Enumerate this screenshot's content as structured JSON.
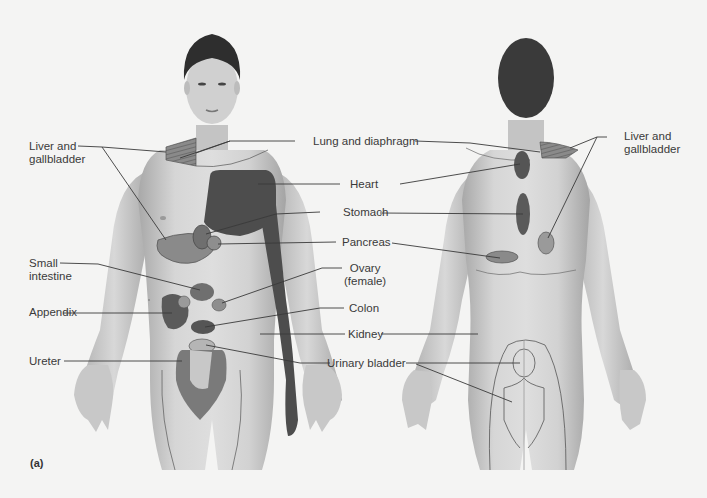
{
  "figure": {
    "panel_label": "(a)",
    "style": "grayscale",
    "colors": {
      "background": "#f4f4f3",
      "skin_light": "#d9d9d9",
      "skin_mid": "#bdbdbd",
      "skin_shadow": "#9a9a9a",
      "hair": "#2e2e2e",
      "region_dark": "#4d4d4d",
      "region_mid": "#7a7a7a",
      "region_light": "#a9a9a9",
      "leader_line": "#3a3a3a",
      "text": "#3a3a3a"
    },
    "views": [
      "anterior",
      "posterior"
    ]
  },
  "labels": {
    "liver_front_l1": "Liver and",
    "liver_front_l2": "gallbladder",
    "lung": "Lung and diaphragm",
    "liver_back_l1": "Liver and",
    "liver_back_l2": "gallbladder",
    "heart": "Heart",
    "stomach": "Stomach",
    "pancreas": "Pancreas",
    "small_int_l1": "Small",
    "small_int_l2": "intestine",
    "ovary_l1": "Ovary",
    "ovary_l2": "(female)",
    "appendix": "Appendix",
    "colon": "Colon",
    "kidney": "Kidney",
    "ureter": "Ureter",
    "bladder": "Urinary bladder"
  }
}
